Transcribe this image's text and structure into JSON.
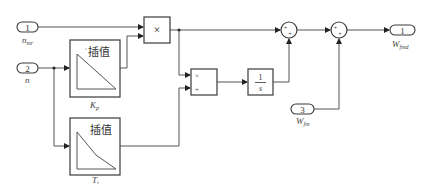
{
  "diagram": {
    "inports": [
      {
        "number": "1",
        "label": "n",
        "label_sub": "mr"
      },
      {
        "number": "2",
        "label": "n",
        "label_sub": ""
      },
      {
        "number": "3",
        "label": "W",
        "label_sub": "fm"
      }
    ],
    "outports": [
      {
        "number": "1",
        "label": "W",
        "label_sub": "fmd"
      }
    ],
    "lookup_tables": [
      {
        "title": "插值",
        "label": "K",
        "label_sub": "p"
      },
      {
        "title": "插值",
        "label": "T",
        "label_sub": "i"
      }
    ],
    "product": {
      "symbol": "×"
    },
    "divide": {
      "mul_symbol": "×",
      "div_symbol": "÷"
    },
    "integrator": {
      "numerator": "1",
      "denominator": "s"
    },
    "sums": [
      {
        "signs": [
          "+",
          "+"
        ]
      },
      {
        "signs": [
          "+",
          "+"
        ]
      }
    ],
    "colors": {
      "stroke": "#3a3a3a",
      "wire": "#555555",
      "background": "#ffffff"
    }
  }
}
